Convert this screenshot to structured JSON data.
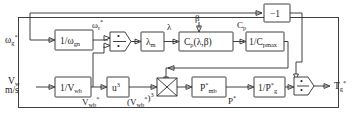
{
  "diagram": {
    "colors": {
      "line": "#2b2b2b",
      "text": "#1b1b1b",
      "background": "#ffffff"
    },
    "inputs": [
      {
        "id": "omega-g-ref",
        "main": "ω",
        "sub": "g",
        "sup": "*",
        "unit": ""
      },
      {
        "id": "wind-speed",
        "main": "V",
        "sub": "w",
        "sup": "",
        "unit": "m/s"
      }
    ],
    "outputs": [
      {
        "id": "torque-g-ref",
        "main": "T",
        "sub": "g",
        "sup": "*"
      }
    ],
    "blocks": [
      {
        "id": "inv-omega-gn",
        "label": "1/ω",
        "sub": "gn",
        "sup": ""
      },
      {
        "id": "lambda-m",
        "label": "λ",
        "sub": "m",
        "sup": ""
      },
      {
        "id": "cp-lambda-beta",
        "label": "C",
        "sub": "p",
        "sup": "",
        "arg": "(λ,β)"
      },
      {
        "id": "inv-cpmax",
        "label": "1/C",
        "sub": "pmax",
        "sup": ""
      },
      {
        "id": "gain-minus-one",
        "label": "−1",
        "sub": "",
        "sup": ""
      },
      {
        "id": "inv-v-wb",
        "label": "1/V",
        "sub": "wb",
        "sup": ""
      },
      {
        "id": "u-cubed",
        "label": "u",
        "sub": "",
        "sup": "3"
      },
      {
        "id": "p-mb-ref",
        "label": "P",
        "sub": "mb",
        "sup": "*"
      },
      {
        "id": "inv-p-g-ref",
        "label": "1/P",
        "sub": "g",
        "sup": "*"
      }
    ],
    "operators": [
      {
        "id": "divider-top",
        "symbol": "÷",
        "kind": "divide"
      },
      {
        "id": "multiplier",
        "symbol": "×",
        "kind": "multiply"
      },
      {
        "id": "divider-output",
        "symbol": "÷",
        "kind": "divide"
      }
    ],
    "signals": [
      {
        "id": "omega-r-ref",
        "main": "ω",
        "sub": "r",
        "sup": "*"
      },
      {
        "id": "lambda",
        "main": "λ",
        "sub": "",
        "sup": ""
      },
      {
        "id": "beta",
        "main": "β",
        "sub": "",
        "sup": ""
      },
      {
        "id": "cp",
        "main": "C",
        "sub": "p",
        "sup": ""
      },
      {
        "id": "v-wb-ref",
        "main": "V",
        "sub": "wb",
        "sup": "*"
      },
      {
        "id": "v-wb-ref-cubed",
        "main": "(V",
        "sub": "wb",
        "sup": "*",
        "tail": ")",
        "tailsup": "3"
      },
      {
        "id": "p-ref",
        "main": "P",
        "sub": "",
        "sup": "*"
      }
    ]
  }
}
